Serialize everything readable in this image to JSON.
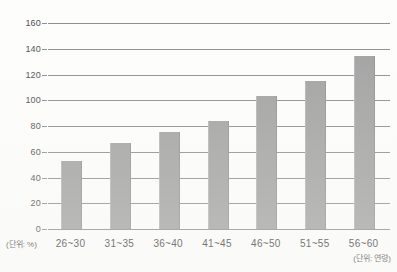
{
  "chart_data": {
    "type": "bar",
    "title": "",
    "xlabel": "(단위: 연령)",
    "ylabel": "(단위: %)",
    "categories": [
      "26~30",
      "31~35",
      "36~40",
      "41~45",
      "46~50",
      "51~55",
      "56~60"
    ],
    "values": [
      53,
      67,
      75,
      84,
      103,
      115,
      134
    ],
    "ylim": [
      0,
      160
    ],
    "yticks": [
      0,
      20,
      40,
      60,
      80,
      100,
      120,
      140,
      160
    ],
    "ytick_labels": [
      "0",
      "20",
      "40",
      "60",
      "80",
      "100",
      "120",
      "140",
      "160"
    ],
    "grid": true,
    "legend": "none",
    "series": [
      {
        "name": "",
        "values": [
          53,
          67,
          75,
          84,
          103,
          115,
          134
        ],
        "color": "#a0a0a0"
      }
    ]
  },
  "colors": {
    "bar": "#a0a0a0",
    "gridline": "#8c8c8c",
    "text": "#3b3b3b",
    "background": "#fdfdfc"
  }
}
